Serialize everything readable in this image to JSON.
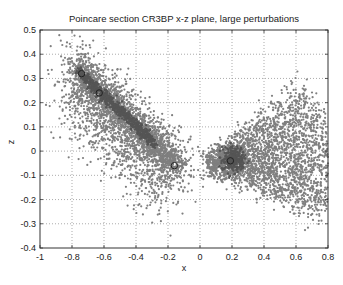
{
  "chart_data": {
    "type": "scatter",
    "title": "Poincare section CR3BP x-z plane, large perturbations",
    "xlabel": "x",
    "ylabel": "z",
    "xlim": [
      -1,
      0.8
    ],
    "ylim": [
      -0.4,
      0.5
    ],
    "xticks": [
      -1,
      -0.8,
      -0.6,
      -0.4,
      -0.2,
      0,
      0.2,
      0.4,
      0.6,
      0.8
    ],
    "yticks": [
      -0.4,
      -0.3,
      -0.2,
      -0.1,
      0,
      0.1,
      0.2,
      0.3,
      0.4,
      0.5
    ],
    "xtick_labels": [
      "-1",
      "-0.8",
      "-0.6",
      "-0.4",
      "-0.2",
      "0",
      "0.2",
      "0.4",
      "0.6",
      "0.8"
    ],
    "ytick_labels": [
      "-0.4",
      "-0.3",
      "-0.2",
      "-0.1",
      "0",
      "0.1",
      "0.2",
      "0.3",
      "0.4",
      "0.5"
    ],
    "grid": true,
    "legend": null,
    "series": [
      {
        "name": "left cluster (dense band)",
        "description": "diagonal band from (-0.78,0.34) down to (-0.12,-0.08), spread points to (-0.9,-0.35)",
        "band_start": [
          -0.76,
          0.33
        ],
        "band_end": [
          -0.12,
          -0.07
        ],
        "color": "#7a7a7a"
      },
      {
        "name": "right cluster (fan)",
        "description": "fan from (0.05,-0.05) spreading up-right to (0.8,0.38) and down-right to (0.6,-0.35)",
        "apex": [
          0.05,
          -0.05
        ],
        "color": "#7a7a7a"
      }
    ],
    "markers": [
      {
        "x": -0.74,
        "y": 0.32,
        "style": "circle"
      },
      {
        "x": -0.63,
        "y": 0.24,
        "style": "circle"
      },
      {
        "x": -0.16,
        "y": -0.06,
        "style": "circle"
      },
      {
        "x": 0.19,
        "y": -0.04,
        "style": "circle"
      }
    ],
    "colors": {
      "points": "#7f7f7f",
      "dense": "#555555",
      "grid": "#888888",
      "axes": "#333333"
    }
  }
}
